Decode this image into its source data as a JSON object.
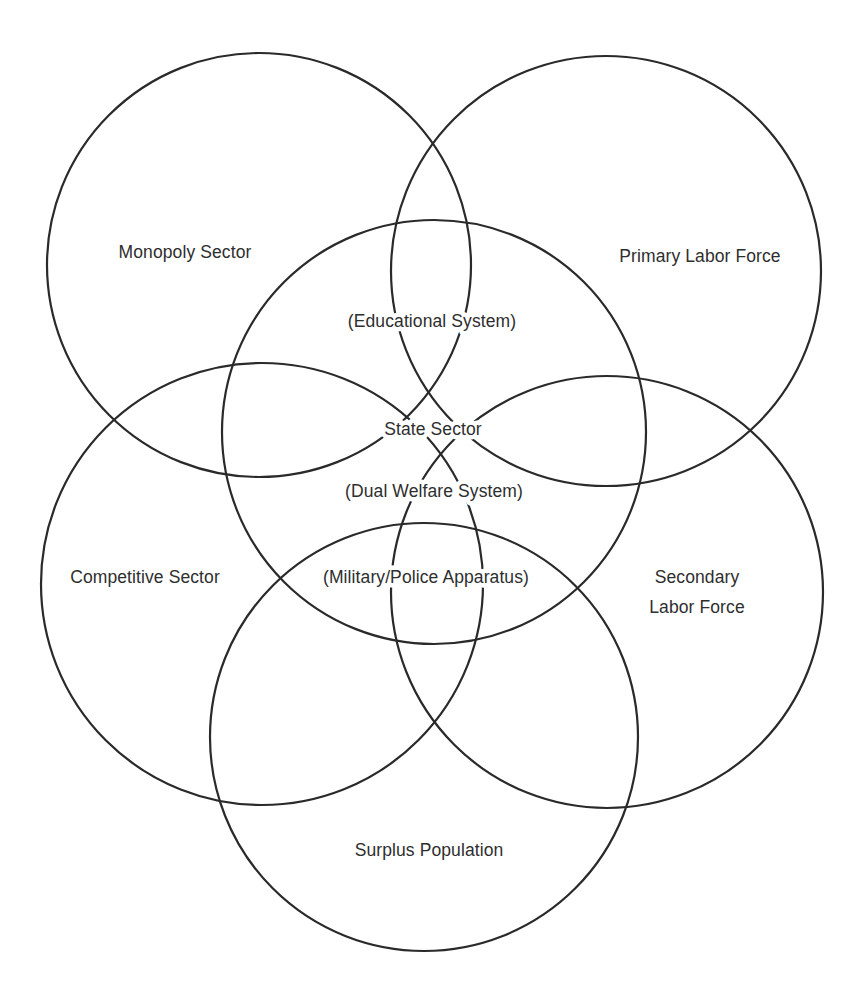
{
  "diagram": {
    "type": "overlapping-circles",
    "stroke_color": "#2a2a2a",
    "background_color": "#ffffff",
    "text_color": "#2e2e2e",
    "circles": [
      {
        "id": "monopoly-sector",
        "label": "Monopoly Sector",
        "cx": 259,
        "cy": 265,
        "r": 212
      },
      {
        "id": "primary-labor-force",
        "label": "Primary Labor Force",
        "cx": 606,
        "cy": 271,
        "r": 215
      },
      {
        "id": "state-sector",
        "label": "State Sector",
        "cx": 434,
        "cy": 432,
        "r": 212
      },
      {
        "id": "competitive-sector",
        "label": "Competitive Sector",
        "cx": 262,
        "cy": 584,
        "r": 221
      },
      {
        "id": "secondary-labor-force",
        "label": "Secondary Labor Force",
        "cx": 607,
        "cy": 592,
        "r": 216
      },
      {
        "id": "surplus-population",
        "label": "Surplus Population",
        "cx": 424,
        "cy": 737,
        "r": 214
      }
    ],
    "labels": {
      "monopoly_sector": "Monopoly Sector",
      "primary_labor_force": "Primary Labor Force",
      "educational_system": "(Educational System)",
      "state_sector": "State Sector",
      "dual_welfare_system": "(Dual Welfare System)",
      "competitive_sector": "Competitive Sector",
      "military_police_apparatus": "(Military/Police Apparatus)",
      "secondary_labor_force_line1": "Secondary",
      "secondary_labor_force_line2": "Labor Force",
      "surplus_population": "Surplus Population"
    }
  }
}
